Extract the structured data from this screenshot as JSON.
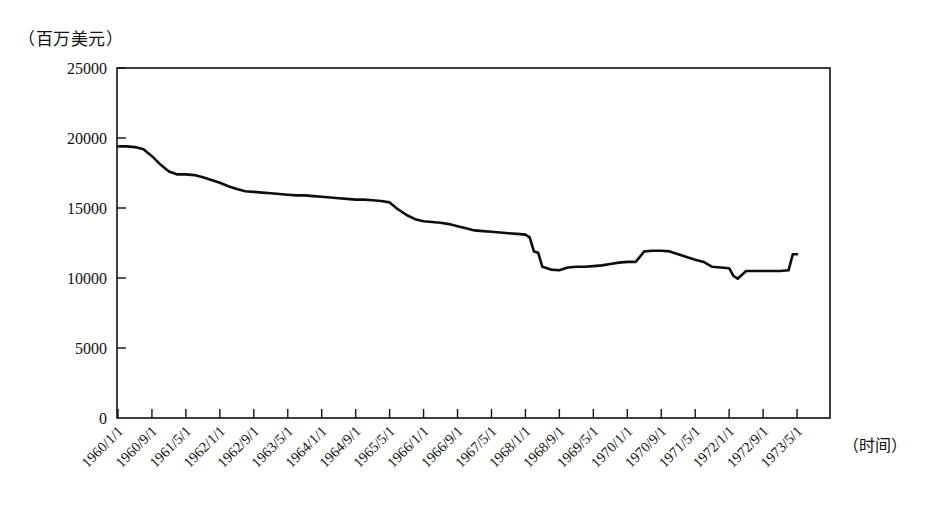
{
  "figure": {
    "unit_label": "（百万美元）",
    "xaxis_label": "（时间）"
  },
  "chart_data": {
    "type": "line",
    "title": "",
    "subtitle": "",
    "xlabel": "（时间）",
    "ylabel": "（百万美元）",
    "ylim": [
      0,
      25000
    ],
    "ytick_labels": [
      "0",
      "5000",
      "10000",
      "15000",
      "20000",
      "25000"
    ],
    "ytick_values": [
      0,
      5000,
      10000,
      15000,
      20000,
      25000
    ],
    "grid": false,
    "legend": "none",
    "xtick_labels": [
      "1960/1/1",
      "1960/9/1",
      "1961/5/1",
      "1962/1/1",
      "1962/9/1",
      "1963/5/1",
      "1964/1/1",
      "1964/9/1",
      "1965/5/1",
      "1966/1/1",
      "1966/9/1",
      "1967/5/1",
      "1968/1/1",
      "1968/9/1",
      "1969/5/1",
      "1970/1/1",
      "1970/9/1",
      "1971/5/1",
      "1972/1/1",
      "1972/9/1",
      "1973/5/1"
    ],
    "series": [
      {
        "name": "储备量",
        "color": "#0d0d0d",
        "x": [
          "1960/1/1",
          "1960/3/1",
          "1960/5/1",
          "1960/7/1",
          "1960/9/1",
          "1960/11/1",
          "1961/1/1",
          "1961/3/1",
          "1961/5/1",
          "1961/7/1",
          "1961/9/1",
          "1961/11/1",
          "1962/1/1",
          "1962/3/1",
          "1962/5/1",
          "1962/7/1",
          "1962/9/1",
          "1962/11/1",
          "1963/1/1",
          "1963/3/1",
          "1963/5/1",
          "1963/7/1",
          "1963/9/1",
          "1963/11/1",
          "1964/1/1",
          "1964/3/1",
          "1964/5/1",
          "1964/7/1",
          "1964/9/1",
          "1964/11/1",
          "1965/1/1",
          "1965/3/1",
          "1965/5/1",
          "1965/7/1",
          "1965/9/1",
          "1965/11/1",
          "1966/1/1",
          "1966/3/1",
          "1966/5/1",
          "1966/7/1",
          "1966/9/1",
          "1966/11/1",
          "1967/1/1",
          "1967/3/1",
          "1967/5/1",
          "1967/7/1",
          "1967/9/1",
          "1967/11/1",
          "1968/1/1",
          "1968/2/1",
          "1968/3/1",
          "1968/4/1",
          "1968/5/1",
          "1968/7/1",
          "1968/9/1",
          "1968/11/1",
          "1969/1/1",
          "1969/3/1",
          "1969/5/1",
          "1969/7/1",
          "1969/9/1",
          "1969/11/1",
          "1970/1/1",
          "1970/3/1",
          "1970/5/1",
          "1970/7/1",
          "1970/9/1",
          "1970/11/1",
          "1971/1/1",
          "1971/3/1",
          "1971/5/1",
          "1971/7/1",
          "1971/9/1",
          "1971/11/1",
          "1972/1/1",
          "1972/2/1",
          "1972/3/1",
          "1972/5/1",
          "1972/7/1",
          "1972/9/1",
          "1972/11/1",
          "1973/1/1",
          "1973/3/1",
          "1973/4/1",
          "1973/5/1"
        ],
        "values": [
          19400,
          19400,
          19350,
          19200,
          18700,
          18100,
          17600,
          17400,
          17400,
          17350,
          17200,
          17000,
          16800,
          16550,
          16350,
          16200,
          16150,
          16100,
          16050,
          16000,
          15950,
          15900,
          15900,
          15850,
          15800,
          15750,
          15700,
          15650,
          15600,
          15600,
          15550,
          15500,
          15400,
          14900,
          14500,
          14200,
          14050,
          14000,
          13950,
          13850,
          13700,
          13550,
          13400,
          13350,
          13300,
          13250,
          13200,
          13150,
          13100,
          12900,
          11900,
          11800,
          10800,
          10600,
          10550,
          10750,
          10800,
          10800,
          10850,
          10900,
          11000,
          11100,
          11150,
          11150,
          11900,
          11950,
          11950,
          11900,
          11700,
          11500,
          11300,
          11150,
          10800,
          10750,
          10700,
          10150,
          9950,
          10500,
          10500,
          10500,
          10500,
          10500,
          10550,
          11700,
          11700
        ]
      }
    ]
  }
}
